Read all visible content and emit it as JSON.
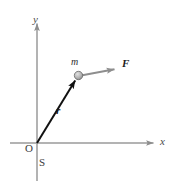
{
  "figure": {
    "background_color": "#ffffff",
    "width": 178,
    "height": 185
  },
  "axes": {
    "x_label": "x",
    "y_label": "y",
    "origin_label": "O",
    "frame_label": "S",
    "axis_color": "#9a9a9a",
    "x_axis": {
      "x_start": 10,
      "x_end": 155,
      "y": 143
    },
    "y_axis": {
      "y_start": 22,
      "y_end": 181,
      "x": 37
    }
  },
  "vectors": [
    {
      "name": "position-vector",
      "label": "r",
      "color": "#111111",
      "from": {
        "x": 37,
        "y": 143
      },
      "to": {
        "x": 78,
        "y": 76
      },
      "label_pos": {
        "x": 56,
        "y": 105
      }
    },
    {
      "name": "force-vector",
      "label": "F",
      "color": "#8e8e8e",
      "from": {
        "x": 80,
        "y": 75
      },
      "to": {
        "x": 118,
        "y": 68
      },
      "label_pos": {
        "x": 122,
        "y": 58
      }
    }
  ],
  "particle": {
    "mass_label": "m",
    "center": {
      "x": 78,
      "y": 76
    },
    "radius": 4,
    "fill_color": "#b4b4b4",
    "stroke_color": "#5a5a5a"
  }
}
